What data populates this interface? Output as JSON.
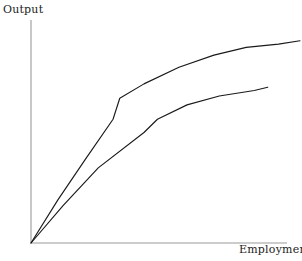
{
  "chart_data": {
    "type": "line",
    "title": "",
    "xlabel": "Employment",
    "ylabel": "Output",
    "grid": false,
    "legend": null,
    "axis_color": "#9a9a9a",
    "curve_color": "#1a1a1a",
    "xlim": [
      0,
      1
    ],
    "ylim": [
      0,
      1
    ],
    "series": [
      {
        "name": "upper-curve",
        "color": "#1a1a1a",
        "points": [
          {
            "x": 0.0,
            "y": 0.0
          },
          {
            "x": 0.1,
            "y": 0.195
          },
          {
            "x": 0.2,
            "y": 0.375
          },
          {
            "x": 0.305,
            "y": 0.56
          },
          {
            "x": 0.33,
            "y": 0.655
          },
          {
            "x": 0.42,
            "y": 0.72
          },
          {
            "x": 0.55,
            "y": 0.795
          },
          {
            "x": 0.68,
            "y": 0.85
          },
          {
            "x": 0.8,
            "y": 0.885
          },
          {
            "x": 0.92,
            "y": 0.9
          },
          {
            "x": 1.0,
            "y": 0.915
          }
        ]
      },
      {
        "name": "lower-curve",
        "color": "#1a1a1a",
        "points": [
          {
            "x": 0.0,
            "y": 0.0
          },
          {
            "x": 0.12,
            "y": 0.17
          },
          {
            "x": 0.25,
            "y": 0.34
          },
          {
            "x": 0.42,
            "y": 0.5
          },
          {
            "x": 0.47,
            "y": 0.56
          },
          {
            "x": 0.58,
            "y": 0.625
          },
          {
            "x": 0.7,
            "y": 0.665
          },
          {
            "x": 0.83,
            "y": 0.69
          },
          {
            "x": 0.88,
            "y": 0.705
          }
        ]
      }
    ]
  },
  "labels": {
    "y_axis": "Output",
    "x_axis": "Employment"
  }
}
